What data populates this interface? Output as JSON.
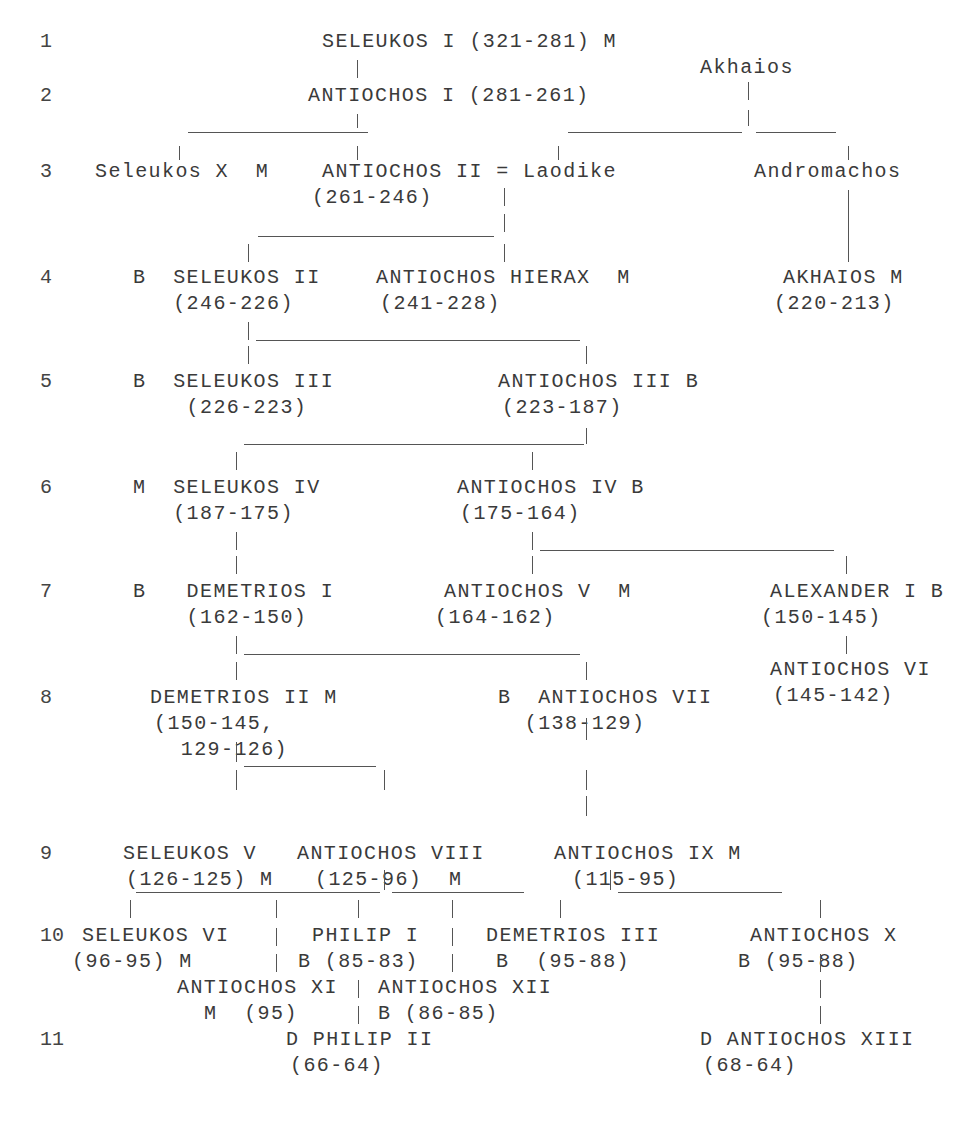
{
  "diagram": {
    "type": "genealogical-tree",
    "generations": [
      {
        "label": "1",
        "y": 32
      },
      {
        "label": "2",
        "y": 86
      },
      {
        "label": "3",
        "y": 162
      },
      {
        "label": "4",
        "y": 268
      },
      {
        "label": "5",
        "y": 372
      },
      {
        "label": "6",
        "y": 478
      },
      {
        "label": "7",
        "y": 582
      },
      {
        "label": "8",
        "y": 688
      },
      {
        "label": "9",
        "y": 844
      },
      {
        "label": "10",
        "y": 926
      },
      {
        "label": "11",
        "y": 1030
      }
    ],
    "nodes": [
      {
        "id": "seleukos-i",
        "lines": [
          "SELEUKOS I (321-281) M"
        ],
        "x": 322,
        "y": 32
      },
      {
        "id": "akhaios-elder",
        "lines": [
          "Akhaios"
        ],
        "x": 700,
        "y": 58
      },
      {
        "id": "antiochos-i",
        "lines": [
          "ANTIOCHOS I (281-261)"
        ],
        "x": 308,
        "y": 86
      },
      {
        "id": "seleukos-x",
        "lines": [
          "Seleukos X  M"
        ],
        "x": 95,
        "y": 162
      },
      {
        "id": "antiochos-ii",
        "lines": [
          "ANTIOCHOS II = Laodike",
          "(261-246)"
        ],
        "x": 322,
        "y": 162,
        "subx": 312
      },
      {
        "id": "andromachos",
        "lines": [
          "Andromachos"
        ],
        "x": 754,
        "y": 162
      },
      {
        "id": "seleukos-ii",
        "lines": [
          "B  SELEUKOS II",
          "   (246-226)"
        ],
        "x": 133,
        "y": 268
      },
      {
        "id": "antiochos-hierax",
        "lines": [
          "ANTIOCHOS HIERAX  M",
          "(241-228)"
        ],
        "x": 376,
        "y": 268,
        "subx": 380
      },
      {
        "id": "akhaios",
        "lines": [
          "AKHAIOS M",
          "(220-213)"
        ],
        "x": 783,
        "y": 268,
        "subx": 774
      },
      {
        "id": "seleukos-iii",
        "lines": [
          "B  SELEUKOS III",
          "    (226-223)"
        ],
        "x": 133,
        "y": 372
      },
      {
        "id": "antiochos-iii",
        "lines": [
          "ANTIOCHOS III B",
          "(223-187)"
        ],
        "x": 498,
        "y": 372,
        "subx": 502
      },
      {
        "id": "seleukos-iv",
        "lines": [
          "M  SELEUKOS IV",
          "   (187-175)"
        ],
        "x": 133,
        "y": 478
      },
      {
        "id": "antiochos-iv",
        "lines": [
          "ANTIOCHOS IV B",
          "(175-164)"
        ],
        "x": 457,
        "y": 478,
        "subx": 460
      },
      {
        "id": "demetrios-i",
        "lines": [
          "B   DEMETRIOS I",
          "    (162-150)"
        ],
        "x": 133,
        "y": 582
      },
      {
        "id": "antiochos-v",
        "lines": [
          "ANTIOCHOS V  M",
          "(164-162)"
        ],
        "x": 444,
        "y": 582,
        "subx": 435
      },
      {
        "id": "alexander-i",
        "lines": [
          "ALEXANDER I B",
          "(150-145)"
        ],
        "x": 770,
        "y": 582,
        "subx": 761
      },
      {
        "id": "antiochos-vi",
        "lines": [
          "ANTIOCHOS VI",
          "(145-142)"
        ],
        "x": 770,
        "y": 660,
        "subx": 773
      },
      {
        "id": "demetrios-ii",
        "lines": [
          "DEMETRIOS II M",
          "(150-145,",
          "  129-126)"
        ],
        "x": 150,
        "y": 688,
        "subx": 154
      },
      {
        "id": "antiochos-vii",
        "lines": [
          "B  ANTIOCHOS VII",
          "  (138-129)"
        ],
        "x": 498,
        "y": 688
      },
      {
        "id": "seleukos-v",
        "lines": [
          "SELEUKOS V",
          "(126-125) M"
        ],
        "x": 123,
        "y": 844,
        "subx": 126
      },
      {
        "id": "antiochos-viii",
        "lines": [
          "ANTIOCHOS VIII",
          "(125-96)  M"
        ],
        "x": 297,
        "y": 844,
        "subx": 315
      },
      {
        "id": "antiochos-ix",
        "lines": [
          "ANTIOCHOS IX M",
          "(115-95)"
        ],
        "x": 554,
        "y": 844,
        "subx": 572
      },
      {
        "id": "seleukos-vi",
        "lines": [
          "SELEUKOS VI",
          "(96-95) M"
        ],
        "x": 82,
        "y": 926,
        "subx": 72
      },
      {
        "id": "philip-i",
        "lines": [
          "PHILIP I",
          "B (85-83)"
        ],
        "x": 312,
        "y": 926,
        "subx": 298
      },
      {
        "id": "demetrios-iii",
        "lines": [
          "DEMETRIOS III",
          "B  (95-88)"
        ],
        "x": 486,
        "y": 926,
        "subx": 496
      },
      {
        "id": "antiochos-x",
        "lines": [
          "ANTIOCHOS X",
          "B (95-88)"
        ],
        "x": 750,
        "y": 926,
        "subx": 738
      },
      {
        "id": "antiochos-xi",
        "lines": [
          "ANTIOCHOS XI",
          "M  (95)"
        ],
        "x": 177,
        "y": 978,
        "subx": 204
      },
      {
        "id": "antiochos-xii",
        "lines": [
          "ANTIOCHOS XII",
          "B (86-85)"
        ],
        "x": 378,
        "y": 978,
        "subx": 378
      },
      {
        "id": "philip-ii",
        "lines": [
          "D PHILIP II",
          "(66-64)"
        ],
        "x": 286,
        "y": 1030,
        "subx": 290
      },
      {
        "id": "antiochos-xiii",
        "lines": [
          "D ANTIOCHOS XIII",
          "(68-64)"
        ],
        "x": 700,
        "y": 1030,
        "subx": 703
      }
    ],
    "marker_legend": [
      "B",
      "M",
      "D"
    ],
    "edges_note": "Descent drawn with ASCII-style pipes '|' and underscores '_'"
  },
  "connectors": {
    "v": [
      [
        357,
        60,
        78
      ],
      [
        748,
        82,
        100
      ],
      [
        357,
        114,
        128
      ],
      [
        748,
        110,
        126
      ],
      [
        179,
        146,
        160
      ],
      [
        357,
        146,
        160
      ],
      [
        558,
        146,
        160
      ],
      [
        848,
        146,
        160
      ],
      [
        504,
        188,
        206
      ],
      [
        504,
        214,
        232
      ],
      [
        248,
        244,
        262
      ],
      [
        504,
        244,
        262
      ],
      [
        848,
        190,
        262
      ],
      [
        248,
        322,
        340
      ],
      [
        248,
        346,
        364
      ],
      [
        586,
        346,
        364
      ],
      [
        586,
        428,
        444
      ],
      [
        236,
        452,
        470
      ],
      [
        532,
        452,
        470
      ],
      [
        236,
        532,
        550
      ],
      [
        236,
        556,
        574
      ],
      [
        532,
        532,
        550
      ],
      [
        532,
        556,
        574
      ],
      [
        846,
        556,
        574
      ],
      [
        846,
        636,
        654
      ],
      [
        236,
        636,
        654
      ],
      [
        236,
        662,
        680
      ],
      [
        586,
        662,
        680
      ],
      [
        236,
        742,
        762
      ],
      [
        236,
        770,
        790
      ],
      [
        384,
        770,
        790
      ],
      [
        586,
        718,
        740
      ],
      [
        586,
        770,
        790
      ],
      [
        586,
        796,
        816
      ],
      [
        384,
        870,
        890
      ],
      [
        610,
        870,
        890
      ],
      [
        130,
        900,
        918
      ],
      [
        276,
        900,
        918
      ],
      [
        358,
        900,
        918
      ],
      [
        452,
        900,
        918
      ],
      [
        560,
        900,
        918
      ],
      [
        820,
        900,
        918
      ],
      [
        276,
        928,
        946
      ],
      [
        276,
        954,
        972
      ],
      [
        452,
        928,
        946
      ],
      [
        452,
        954,
        972
      ],
      [
        358,
        980,
        998
      ],
      [
        358,
        1006,
        1024
      ],
      [
        820,
        954,
        972
      ],
      [
        820,
        980,
        998
      ],
      [
        820,
        1006,
        1024
      ]
    ],
    "h": [
      [
        188,
        368,
        132
      ],
      [
        568,
        742,
        132
      ],
      [
        756,
        836,
        132
      ],
      [
        258,
        494,
        236
      ],
      [
        256,
        580,
        340
      ],
      [
        244,
        584,
        444
      ],
      [
        540,
        834,
        550
      ],
      [
        244,
        580,
        654
      ],
      [
        244,
        376,
        766
      ],
      [
        136,
        380,
        892
      ],
      [
        392,
        524,
        892
      ],
      [
        618,
        782,
        892
      ]
    ]
  }
}
